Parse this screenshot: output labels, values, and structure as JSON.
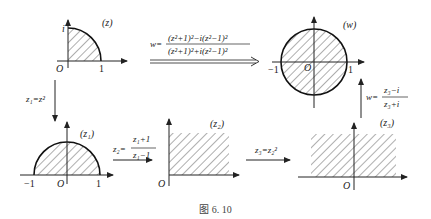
{
  "figure": {
    "caption": "图 6. 10",
    "panels": {
      "z": {
        "label": "(z)",
        "axis_labels": {
          "origin": "O",
          "x_tick": "1",
          "y_tick": "i"
        },
        "region": "quarter disk, first quadrant"
      },
      "w": {
        "label": "(w)",
        "axis_labels": {
          "origin": "O",
          "x_tick_neg": "−1",
          "x_tick_pos": "1"
        },
        "region": "unit disk"
      },
      "z1": {
        "label": "(z₁)",
        "axis_labels": {
          "origin": "O",
          "x_tick_neg": "−1",
          "x_tick_pos": "1"
        },
        "region": "upper half unit disk"
      },
      "z2": {
        "label": "(z₂)",
        "axis_labels": {
          "origin": "O"
        },
        "region": "first quadrant"
      },
      "z3": {
        "label": "(z₃)",
        "axis_labels": {
          "origin": "O"
        },
        "region": "upper half plane"
      }
    },
    "maps": {
      "z_to_w": {
        "lhs": "w=",
        "numerator": "(z²+1)²−i(z²−1)²",
        "denominator": "(z²+1)²+i(z²−1)²"
      },
      "z_to_z1": {
        "text": "z₁=z²"
      },
      "z1_to_z2": {
        "lhs": "z₂=",
        "numerator": "z₁+1",
        "denominator": "z₁−1"
      },
      "z2_to_z3": {
        "text": "z₃=z₂²"
      },
      "z3_to_w": {
        "lhs": "w=",
        "numerator": "z₃−i",
        "denominator": "z₃+i"
      }
    }
  }
}
